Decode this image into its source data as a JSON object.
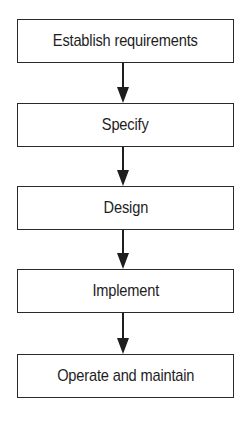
{
  "diagram": {
    "type": "flowchart",
    "direction": "top-to-bottom",
    "steps": [
      {
        "label": "Establish requirements"
      },
      {
        "label": "Specify"
      },
      {
        "label": "Design"
      },
      {
        "label": "Implement"
      },
      {
        "label": "Operate and maintain"
      }
    ],
    "connections": [
      {
        "from": "Establish requirements",
        "to": "Specify"
      },
      {
        "from": "Specify",
        "to": "Design"
      },
      {
        "from": "Design",
        "to": "Implement"
      },
      {
        "from": "Implement",
        "to": "Operate and maintain"
      }
    ],
    "colors": {
      "stroke": "#2a2a2a",
      "text": "#1e1e1e",
      "background": "#ffffff"
    }
  }
}
